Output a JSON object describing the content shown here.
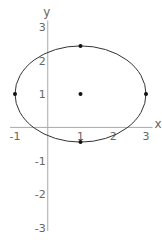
{
  "chart_data": {
    "type": "scatter",
    "title": "",
    "xlabel": "x",
    "ylabel": "y",
    "xlim": [
      -1.15,
      3.2
    ],
    "ylim": [
      -3.1,
      3.2
    ],
    "grid": false,
    "legend": null,
    "x_ticks": [
      -1,
      1,
      2,
      3
    ],
    "y_ticks": [
      -3,
      -2,
      -1,
      1,
      2,
      3
    ],
    "x_tick_labels": [
      "-1",
      "1",
      "2",
      "3"
    ],
    "y_tick_labels": [
      "-3",
      "-2",
      "-1",
      "1",
      "2",
      "3"
    ],
    "curve": {
      "name": "ellipse",
      "center": [
        1,
        1
      ],
      "semi_axis_x": 2,
      "semi_axis_y": 1.44
    },
    "series": [
      {
        "name": "marked points",
        "points": [
          {
            "x": -1,
            "y": 1
          },
          {
            "x": 3,
            "y": 1
          },
          {
            "x": 1,
            "y": 2.44
          },
          {
            "x": 1,
            "y": -0.44
          },
          {
            "x": 1,
            "y": 1
          }
        ]
      }
    ],
    "colors": {
      "curve": "#333333",
      "axes": "#a8a8a8",
      "labels": "#666666",
      "points": "#111111"
    }
  }
}
